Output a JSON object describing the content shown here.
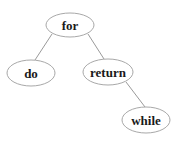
{
  "diagram": {
    "type": "tree",
    "nodes": [
      {
        "id": "for",
        "label": "for",
        "cx": 70,
        "cy": 25,
        "rx": 24,
        "ry": 12
      },
      {
        "id": "do",
        "label": "do",
        "cx": 31,
        "cy": 73,
        "rx": 24,
        "ry": 13
      },
      {
        "id": "return",
        "label": "return",
        "cx": 108,
        "cy": 72,
        "rx": 25,
        "ry": 13
      },
      {
        "id": "while",
        "label": "while",
        "cx": 146,
        "cy": 120,
        "rx": 24,
        "ry": 13
      }
    ],
    "edges": [
      {
        "from": "for",
        "to": "do"
      },
      {
        "from": "for",
        "to": "return"
      },
      {
        "from": "return",
        "to": "while"
      }
    ],
    "colors": {
      "background": "#ffffff",
      "edge": "#9a9a9a",
      "node_border": "#a8a8a8",
      "label": "#1a1a1a"
    }
  }
}
